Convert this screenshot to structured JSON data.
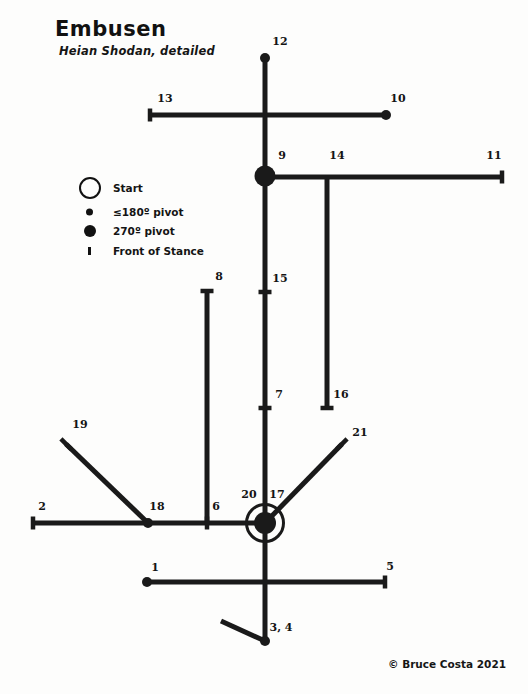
{
  "header": {
    "title": "Embusen",
    "subtitle": "Heian Shodan, detailed"
  },
  "legend": {
    "items": [
      {
        "icon": "open-circle-icon",
        "label": "Start",
        "y": 14
      },
      {
        "icon": "small-dot-icon",
        "label": "≤180º pivot",
        "y": 38
      },
      {
        "icon": "large-dot-icon",
        "label": "270º pivot",
        "y": 57
      },
      {
        "icon": "stance-tick-icon",
        "label": "Front of Stance",
        "y": 77
      }
    ]
  },
  "footer": {
    "copyright": "© Bruce Costa 2021"
  },
  "diagram": {
    "type": "embusen-floor-pattern",
    "start_point": {
      "x": 265,
      "y": 523,
      "label": "Start"
    },
    "steps": [
      {
        "n": "1",
        "label_x": 155,
        "label_y": 567,
        "x": 147,
        "y": 582,
        "marker": "small-dot"
      },
      {
        "n": "2",
        "label_x": 42,
        "label_y": 506,
        "x": 33,
        "y": 523,
        "marker": "stance-tick-vertical"
      },
      {
        "n": "3, 4",
        "label_x": 281,
        "label_y": 627,
        "x": 265,
        "y": 641,
        "marker": "small-dot"
      },
      {
        "n": "5",
        "label_x": 390,
        "label_y": 566,
        "x": 385,
        "y": 582,
        "marker": "stance-tick-vertical"
      },
      {
        "n": "6",
        "label_x": 216,
        "label_y": 506,
        "x": 207,
        "y": 523,
        "marker": "stance-tick-vertical"
      },
      {
        "n": "7",
        "label_x": 279,
        "label_y": 394,
        "x": 265,
        "y": 408,
        "marker": "stance-tick-horizontal"
      },
      {
        "n": "8",
        "label_x": 219,
        "label_y": 276,
        "x": 207,
        "y": 291,
        "marker": "stance-tick-horizontal"
      },
      {
        "n": "9",
        "label_x": 282,
        "label_y": 155,
        "x": 265,
        "y": 176,
        "marker": "large-dot"
      },
      {
        "n": "10",
        "label_x": 398,
        "label_y": 98,
        "x": 386,
        "y": 115,
        "marker": "small-dot"
      },
      {
        "n": "11",
        "label_x": 494,
        "label_y": 155,
        "x": 502,
        "y": 177,
        "marker": "stance-tick-vertical"
      },
      {
        "n": "12",
        "label_x": 280,
        "label_y": 41,
        "x": 265,
        "y": 58,
        "marker": "small-dot"
      },
      {
        "n": "13",
        "label_x": 165,
        "label_y": 98,
        "x": 150,
        "y": 115,
        "marker": "stance-tick-vertical"
      },
      {
        "n": "14",
        "label_x": 337,
        "label_y": 155,
        "x": 327,
        "y": 177,
        "marker": "junction"
      },
      {
        "n": "15",
        "label_x": 280,
        "label_y": 278,
        "x": 265,
        "y": 292,
        "marker": "stance-tick-horizontal"
      },
      {
        "n": "16",
        "label_x": 341,
        "label_y": 394,
        "x": 327,
        "y": 408,
        "marker": "stance-tick-horizontal"
      },
      {
        "n": "17",
        "label_x": 277,
        "label_y": 494,
        "x": 265,
        "y": 523,
        "marker": "start-node"
      },
      {
        "n": "18",
        "label_x": 157,
        "label_y": 506,
        "x": 148,
        "y": 523,
        "marker": "small-dot"
      },
      {
        "n": "19",
        "label_x": 80,
        "label_y": 424,
        "x": 66,
        "y": 444,
        "marker": "stance-tick-diagonal"
      },
      {
        "n": "20",
        "label_x": 249,
        "label_y": 494,
        "x": 265,
        "y": 523,
        "marker": "start-node"
      },
      {
        "n": "21",
        "label_x": 360,
        "label_y": 432,
        "x": 342,
        "y": 444,
        "marker": "stance-tick-diagonal"
      }
    ],
    "segments": [
      {
        "name": "main-vertical-spine",
        "x1": 265,
        "y1": 58,
        "x2": 265,
        "y2": 641
      },
      {
        "name": "upper-horizontal-13-10",
        "x1": 150,
        "y1": 115,
        "x2": 386,
        "y2": 115
      },
      {
        "name": "horizontal-9-11",
        "x1": 265,
        "y1": 177,
        "x2": 502,
        "y2": 177
      },
      {
        "name": "vertical-14-16",
        "x1": 327,
        "y1": 177,
        "x2": 327,
        "y2": 408
      },
      {
        "name": "vertical-8-6",
        "x1": 207,
        "y1": 291,
        "x2": 207,
        "y2": 523
      },
      {
        "name": "lower-horizontal-2-17",
        "x1": 33,
        "y1": 523,
        "x2": 265,
        "y2": 523
      },
      {
        "name": "diagonal-19-18",
        "x1": 66,
        "y1": 444,
        "x2": 148,
        "y2": 523
      },
      {
        "name": "diagonal-21-17",
        "x1": 342,
        "y1": 444,
        "x2": 265,
        "y2": 523
      },
      {
        "name": "bottom-horizontal-1-5",
        "x1": 147,
        "y1": 582,
        "x2": 385,
        "y2": 582
      },
      {
        "name": "diagonal-bottom-3-4",
        "x1": 221,
        "y1": 621,
        "x2": 265,
        "y2": 641
      }
    ],
    "markers": {
      "small_dot_radius": 5,
      "large_dot_radius": 10.5,
      "start_ring_radius": 18.5,
      "tick_length": 13
    }
  }
}
